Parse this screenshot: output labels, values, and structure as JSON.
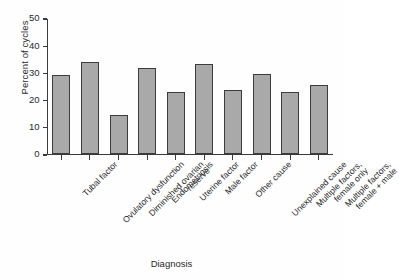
{
  "chart_data": {
    "type": "bar",
    "title": "",
    "xlabel": "Diagnosis",
    "ylabel": "Percent of cycles",
    "ylim": [
      0,
      50
    ],
    "yticks": [
      0,
      10,
      20,
      30,
      40,
      50
    ],
    "grid": false,
    "legend": null,
    "bar_color": "#a9a9a9",
    "bar_edge_color": "#3c3c3c",
    "categories": [
      "Tubal factor",
      "Ovulatory dysfunction",
      "Diminished ovarian reserve",
      "Endometriosis",
      "Uterine factor",
      "Male factor",
      "Other cause",
      "Unexplained cause",
      "Multiple factors, female only",
      "Multiple factors, female + male"
    ],
    "category_lines": [
      [
        "Tubal factor"
      ],
      [
        "Ovulatory dysfunction"
      ],
      [
        "Diminished ovarian",
        "reserve"
      ],
      [
        "Endometriosis"
      ],
      [
        "Uterine factor"
      ],
      [
        "Male factor"
      ],
      [
        "Other cause"
      ],
      [
        "Unexplained cause"
      ],
      [
        "Multiple factors,",
        "female only"
      ],
      [
        "Multiple factors,",
        "female + male"
      ]
    ],
    "values": [
      29,
      33.8,
      14.2,
      31.4,
      22.8,
      32.9,
      23.4,
      29.4,
      22.7,
      25.1
    ]
  }
}
